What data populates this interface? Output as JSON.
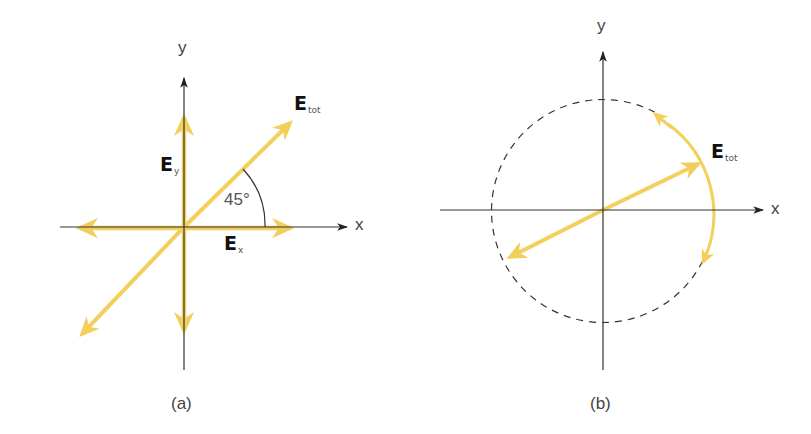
{
  "colors": {
    "axis": "#333333",
    "field": "#f2d05e",
    "dashed_circle": "#333333",
    "background": "#ffffff"
  },
  "panel_a": {
    "caption": "(a)",
    "x_axis_label": "x",
    "y_axis_label": "y",
    "vectors": {
      "ex": {
        "symbol": "E",
        "subscript": "x"
      },
      "ey": {
        "symbol": "E",
        "subscript": "y"
      },
      "etot": {
        "symbol": "E",
        "subscript": "tot"
      }
    },
    "angle_label": "45°",
    "polarization": "linear"
  },
  "panel_b": {
    "caption": "(b)",
    "x_axis_label": "x",
    "y_axis_label": "y",
    "vectors": {
      "etot": {
        "symbol": "E",
        "subscript": "tot"
      }
    },
    "polarization": "circular"
  }
}
